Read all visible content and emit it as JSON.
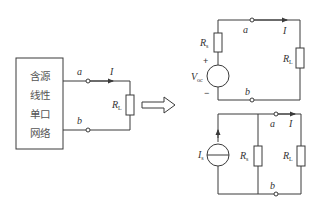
{
  "figure": {
    "colors": {
      "line": "#3a3a3a",
      "text": "#333333",
      "background": "#ffffff"
    }
  },
  "network_box": {
    "lines": [
      "含源",
      "线性",
      "单口",
      "网络"
    ]
  },
  "left_circuit": {
    "terminal_a": "a",
    "terminal_b": "b",
    "current": "I",
    "load": {
      "main": "R",
      "sub": "L"
    }
  },
  "transform_arrow": "hollow-right-arrow",
  "thevenin_circuit": {
    "source_resistor": {
      "main": "R",
      "sub": "s"
    },
    "voltage_source": {
      "main": "V",
      "sub": "oc"
    },
    "plus_sign": "+",
    "minus_sign": "−",
    "terminal_a": "a",
    "terminal_b": "b",
    "current": "I",
    "load": {
      "main": "R",
      "sub": "L"
    }
  },
  "norton_circuit": {
    "current_source": {
      "main": "I",
      "sub": "s"
    },
    "shunt_resistor": {
      "main": "R",
      "sub": "s"
    },
    "terminal_a": "a",
    "terminal_b": "b",
    "current": "I",
    "load": {
      "main": "R",
      "sub": "L"
    }
  }
}
